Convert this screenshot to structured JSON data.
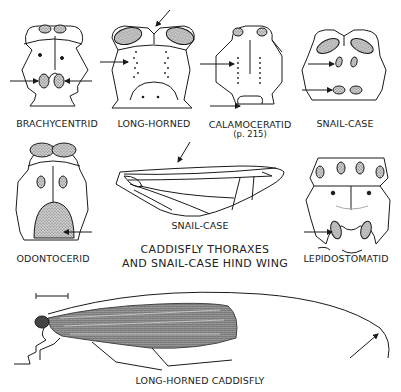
{
  "figure": {
    "caption_line1": "CADDISFLY THORAXES",
    "caption_line2": "AND SNAIL-CASE HIND WING",
    "bottom_caption": "LONG-HORNED CADDISFLY"
  },
  "thoraxes": [
    {
      "id": "brachycentrid",
      "label": "BRACHYCENTRID"
    },
    {
      "id": "long-horned",
      "label": "LONG-HORNED"
    },
    {
      "id": "calamoceratid",
      "label": "CALAMOCERATID",
      "page_ref": "(p. 215)"
    },
    {
      "id": "snail-case",
      "label": "SNAIL-CASE"
    },
    {
      "id": "odontocerid",
      "label": "ODONTOCERID"
    },
    {
      "id": "lepidostomatid",
      "label": "LEPIDOSTOMATID"
    }
  ],
  "wing": {
    "label": "SNAIL-CASE"
  },
  "colors": {
    "ink": "#1a1a1a",
    "stipple": "#8a8a8a",
    "background": "#ffffff"
  }
}
